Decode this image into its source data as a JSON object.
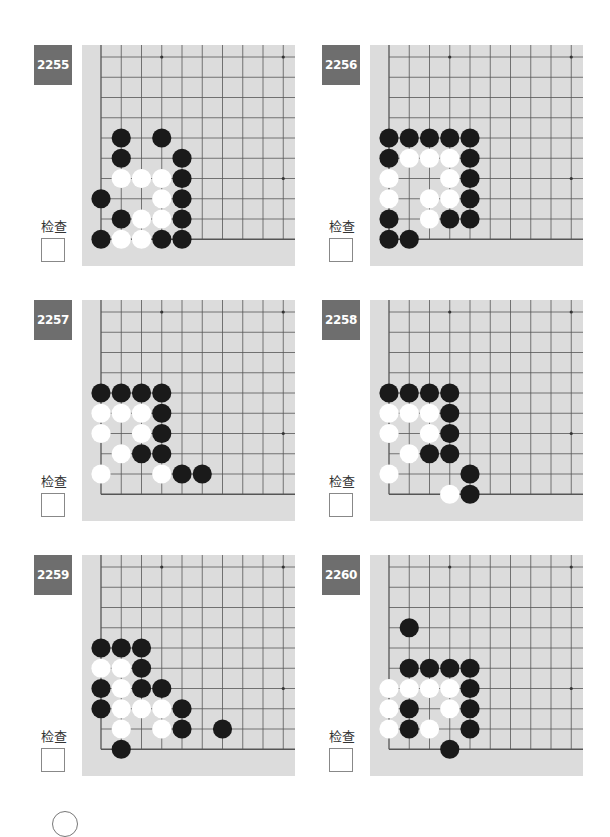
{
  "check_label": "检查",
  "colors": {
    "badge_bg": "#6e6e6e",
    "board_bg": "#dcdcdc",
    "grid_line": "#555555",
    "black_stone": "#1a1a1a",
    "white_stone": "#ffffff"
  },
  "problems": [
    {
      "number": "2255",
      "black": [
        [
          1,
          4
        ],
        [
          3,
          4
        ],
        [
          1,
          5
        ],
        [
          4,
          5
        ],
        [
          4,
          6
        ],
        [
          0,
          7
        ],
        [
          4,
          7
        ],
        [
          1,
          8
        ],
        [
          4,
          8
        ],
        [
          0,
          9
        ],
        [
          3,
          9
        ],
        [
          4,
          9
        ]
      ],
      "white": [
        [
          1,
          6
        ],
        [
          2,
          6
        ],
        [
          3,
          6
        ],
        [
          3,
          7
        ],
        [
          2,
          8
        ],
        [
          3,
          8
        ],
        [
          1,
          9
        ],
        [
          2,
          9
        ]
      ]
    },
    {
      "number": "2256",
      "black": [
        [
          0,
          4
        ],
        [
          1,
          4
        ],
        [
          2,
          4
        ],
        [
          3,
          4
        ],
        [
          4,
          4
        ],
        [
          0,
          5
        ],
        [
          4,
          5
        ],
        [
          4,
          6
        ],
        [
          4,
          7
        ],
        [
          0,
          8
        ],
        [
          3,
          8
        ],
        [
          4,
          8
        ],
        [
          0,
          9
        ],
        [
          1,
          9
        ]
      ],
      "white": [
        [
          1,
          5
        ],
        [
          2,
          5
        ],
        [
          3,
          5
        ],
        [
          0,
          6
        ],
        [
          3,
          6
        ],
        [
          0,
          7
        ],
        [
          2,
          7
        ],
        [
          3,
          7
        ],
        [
          2,
          8
        ]
      ]
    },
    {
      "number": "2257",
      "black": [
        [
          0,
          4
        ],
        [
          1,
          4
        ],
        [
          2,
          4
        ],
        [
          3,
          4
        ],
        [
          3,
          5
        ],
        [
          3,
          6
        ],
        [
          2,
          7
        ],
        [
          3,
          7
        ],
        [
          4,
          8
        ],
        [
          5,
          8
        ]
      ],
      "white": [
        [
          0,
          5
        ],
        [
          1,
          5
        ],
        [
          2,
          5
        ],
        [
          0,
          6
        ],
        [
          2,
          6
        ],
        [
          1,
          7
        ],
        [
          0,
          8
        ],
        [
          3,
          8
        ]
      ]
    },
    {
      "number": "2258",
      "black": [
        [
          0,
          4
        ],
        [
          1,
          4
        ],
        [
          2,
          4
        ],
        [
          3,
          4
        ],
        [
          3,
          5
        ],
        [
          3,
          6
        ],
        [
          2,
          7
        ],
        [
          3,
          7
        ],
        [
          4,
          8
        ],
        [
          4,
          9
        ]
      ],
      "white": [
        [
          0,
          5
        ],
        [
          1,
          5
        ],
        [
          2,
          5
        ],
        [
          0,
          6
        ],
        [
          2,
          6
        ],
        [
          1,
          7
        ],
        [
          0,
          8
        ],
        [
          3,
          9
        ]
      ]
    },
    {
      "number": "2259",
      "black": [
        [
          0,
          4
        ],
        [
          1,
          4
        ],
        [
          2,
          4
        ],
        [
          2,
          5
        ],
        [
          0,
          6
        ],
        [
          2,
          6
        ],
        [
          3,
          6
        ],
        [
          0,
          7
        ],
        [
          4,
          7
        ],
        [
          4,
          8
        ],
        [
          6,
          8
        ],
        [
          1,
          9
        ]
      ],
      "white": [
        [
          0,
          5
        ],
        [
          1,
          5
        ],
        [
          1,
          6
        ],
        [
          1,
          7
        ],
        [
          2,
          7
        ],
        [
          3,
          7
        ],
        [
          1,
          8
        ],
        [
          3,
          8
        ]
      ]
    },
    {
      "number": "2260",
      "black": [
        [
          1,
          3
        ],
        [
          1,
          5
        ],
        [
          2,
          5
        ],
        [
          3,
          5
        ],
        [
          4,
          5
        ],
        [
          4,
          6
        ],
        [
          1,
          7
        ],
        [
          4,
          7
        ],
        [
          1,
          8
        ],
        [
          4,
          8
        ],
        [
          3,
          9
        ]
      ],
      "white": [
        [
          0,
          6
        ],
        [
          1,
          6
        ],
        [
          2,
          6
        ],
        [
          3,
          6
        ],
        [
          0,
          7
        ],
        [
          3,
          7
        ],
        [
          0,
          8
        ],
        [
          2,
          8
        ]
      ]
    }
  ]
}
